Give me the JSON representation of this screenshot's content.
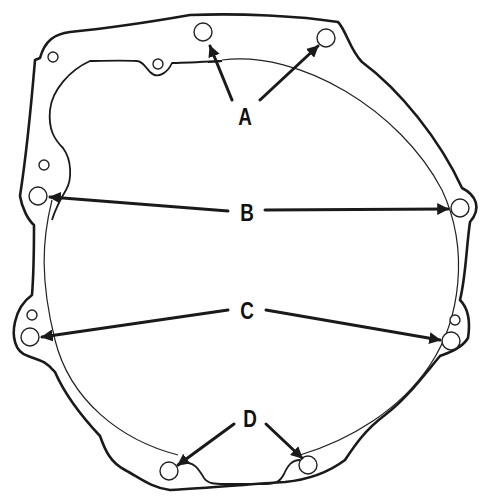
{
  "diagram": {
    "colors": {
      "ink": "#1a1a1a",
      "background": "#ffffff"
    },
    "labels": [
      {
        "id": "A",
        "text": "A",
        "x": 245,
        "y": 117,
        "targets": [
          "hole-a1",
          "hole-a2"
        ]
      },
      {
        "id": "B",
        "text": "B",
        "x": 247,
        "y": 213,
        "targets": [
          "hole-b-left",
          "hole-b-right"
        ]
      },
      {
        "id": "C",
        "text": "C",
        "x": 247,
        "y": 311,
        "targets": [
          "hole-c-left",
          "hole-c-right"
        ]
      },
      {
        "id": "D",
        "text": "D",
        "x": 250,
        "y": 419,
        "targets": [
          "hole-d-left",
          "hole-d-right"
        ]
      }
    ],
    "holes": [
      {
        "id": "hole-a1",
        "group": "A",
        "x": 203,
        "y": 32,
        "r": 9
      },
      {
        "id": "hole-a2",
        "group": "A",
        "x": 326,
        "y": 38,
        "r": 9
      },
      {
        "id": "hole-b-left",
        "group": "B",
        "x": 38,
        "y": 196,
        "r": 9
      },
      {
        "id": "hole-b-right",
        "group": "B",
        "x": 460,
        "y": 208,
        "r": 9
      },
      {
        "id": "hole-c-left",
        "group": "C",
        "x": 30,
        "y": 337,
        "r": 9
      },
      {
        "id": "hole-c-right",
        "group": "C",
        "x": 451,
        "y": 341,
        "r": 9
      },
      {
        "id": "hole-d-left",
        "group": "D",
        "x": 169,
        "y": 471,
        "r": 9
      },
      {
        "id": "hole-d-right",
        "group": "D",
        "x": 308,
        "y": 465,
        "r": 9
      }
    ],
    "small_holes": [
      {
        "x": 53,
        "y": 57,
        "r": 5
      },
      {
        "x": 158,
        "y": 64,
        "r": 5
      },
      {
        "x": 44,
        "y": 165,
        "r": 5
      },
      {
        "x": 32,
        "y": 315,
        "r": 5
      },
      {
        "x": 455,
        "y": 320,
        "r": 5
      }
    ]
  }
}
